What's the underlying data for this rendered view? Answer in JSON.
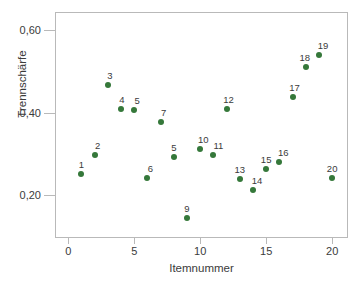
{
  "chart_data": {
    "type": "scatter",
    "title": "",
    "xlabel": "Itemnummer",
    "ylabel": "Trennschärfe",
    "xlim": [
      -1,
      21.2
    ],
    "ylim": [
      0.095,
      0.645
    ],
    "grid": false,
    "legend": null,
    "marker_color": "#35783a",
    "axis_color": "#b9b9b9",
    "label_color": "#3b3b3b",
    "xticks": [
      0,
      5,
      10,
      15,
      20
    ],
    "xticklabels": [
      "0",
      "5",
      "10",
      "15",
      "20"
    ],
    "yticks": [
      0.2,
      0.4,
      0.6
    ],
    "yticklabels": [
      "0,20",
      "0,40",
      "0,60"
    ],
    "points": [
      {
        "label": "1",
        "x": 1,
        "y": 0.25,
        "lx": 0,
        "ly": -4
      },
      {
        "label": "2",
        "x": 2,
        "y": 0.297,
        "lx": 3,
        "ly": -4
      },
      {
        "label": "3",
        "x": 3,
        "y": 0.468,
        "lx": 2,
        "ly": -4
      },
      {
        "label": "4",
        "x": 4,
        "y": 0.409,
        "lx": 1,
        "ly": -4
      },
      {
        "label": "5",
        "x": 5,
        "y": 0.406,
        "lx": 3,
        "ly": -4
      },
      {
        "label": "6",
        "x": 6,
        "y": 0.24,
        "lx": 3,
        "ly": -4
      },
      {
        "label": "7",
        "x": 7,
        "y": 0.377,
        "lx": 3,
        "ly": -4
      },
      {
        "label": "5",
        "x": 8,
        "y": 0.293,
        "lx": 0,
        "ly": -4
      },
      {
        "label": "9",
        "x": 9,
        "y": 0.143,
        "lx": 0,
        "ly": -4
      },
      {
        "label": "10",
        "x": 10,
        "y": 0.312,
        "lx": 3,
        "ly": -4
      },
      {
        "label": "11",
        "x": 11,
        "y": 0.296,
        "lx": 5,
        "ly": -4
      },
      {
        "label": "12",
        "x": 12,
        "y": 0.409,
        "lx": 2,
        "ly": -4
      },
      {
        "label": "13",
        "x": 13,
        "y": 0.239,
        "lx": 0,
        "ly": -4
      },
      {
        "label": "14",
        "x": 14,
        "y": 0.212,
        "lx": 4,
        "ly": -4
      },
      {
        "label": "15",
        "x": 15,
        "y": 0.262,
        "lx": 0,
        "ly": -4
      },
      {
        "label": "16",
        "x": 16,
        "y": 0.279,
        "lx": 4,
        "ly": -4
      },
      {
        "label": "17",
        "x": 17,
        "y": 0.438,
        "lx": 2,
        "ly": -4
      },
      {
        "label": "18",
        "x": 18,
        "y": 0.512,
        "lx": -1,
        "ly": -4
      },
      {
        "label": "19",
        "x": 19,
        "y": 0.541,
        "lx": 4,
        "ly": -4
      },
      {
        "label": "20",
        "x": 20,
        "y": 0.24,
        "lx": 0,
        "ly": -4
      }
    ]
  },
  "caption": ""
}
